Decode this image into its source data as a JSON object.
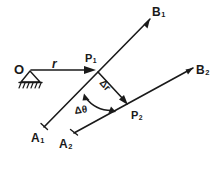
{
  "figure": {
    "ink_color": "#1a1a1a",
    "background_color": "#ffffff",
    "labels": {
      "origin": "O",
      "radius": "r",
      "point1_base": "P",
      "point1_sub": "1",
      "point2_base": "P",
      "point2_sub": "2",
      "ray1_end_base": "B",
      "ray1_end_sub": "1",
      "ray2_end_base": "B",
      "ray2_end_sub": "2",
      "ray1_start_base": "A",
      "ray1_start_sub": "1",
      "ray2_start_base": "A",
      "ray2_start_sub": "2",
      "delta_r": "Δr",
      "delta_theta": "Δθ"
    },
    "geometry": {
      "origin": [
        30,
        70
      ],
      "point1": [
        96,
        70
      ],
      "point2": [
        128,
        105
      ],
      "ray1_start": [
        44,
        127
      ],
      "ray1_end": [
        150,
        19
      ],
      "ray2_start": [
        74,
        133
      ],
      "ray2_end": [
        193,
        68
      ],
      "r_arrow_from": [
        33,
        70
      ],
      "r_arrow_to": [
        95,
        70
      ],
      "delta_r_from": [
        97,
        71
      ],
      "delta_r_to": [
        127,
        104
      ],
      "arc_start": [
        84,
        96
      ],
      "arc_end": [
        115,
        113
      ],
      "support_apex": [
        30,
        72
      ],
      "support_base_left": [
        21,
        83
      ],
      "support_base_right": [
        41,
        83
      ],
      "hatch_count": 6
    }
  }
}
